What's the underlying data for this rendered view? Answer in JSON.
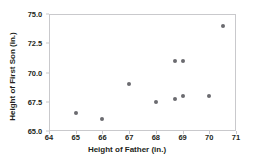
{
  "chart_data": {
    "type": "scatter",
    "title": "",
    "xlabel": "Height of Father (in.)",
    "ylabel": "Height of First Son (in.)",
    "xlim": [
      64,
      71
    ],
    "ylim": [
      65.0,
      75.0
    ],
    "xticks": [
      64,
      65,
      66,
      67,
      68,
      69,
      70,
      71
    ],
    "xtick_labels": [
      "64",
      "65",
      "66",
      "67",
      "68",
      "69",
      "70",
      "71"
    ],
    "yticks": [
      65.0,
      67.5,
      70.0,
      72.5,
      75.0
    ],
    "ytick_labels": [
      "65.0",
      "67.5",
      "70.0",
      "72.5",
      "75.0"
    ],
    "grid": false,
    "legend": null,
    "marker_color": "#6b6b70",
    "frame_color": "#c9c9cc",
    "text_color": "#231f20",
    "background": "#ffffff",
    "points": [
      {
        "x": 65.0,
        "y": 66.5
      },
      {
        "x": 66.0,
        "y": 66.0
      },
      {
        "x": 67.0,
        "y": 69.0
      },
      {
        "x": 68.0,
        "y": 67.5
      },
      {
        "x": 68.7,
        "y": 71.0
      },
      {
        "x": 68.7,
        "y": 67.7
      },
      {
        "x": 69.0,
        "y": 71.0
      },
      {
        "x": 69.0,
        "y": 68.0
      },
      {
        "x": 70.0,
        "y": 68.0
      },
      {
        "x": 70.5,
        "y": 74.0
      }
    ]
  }
}
